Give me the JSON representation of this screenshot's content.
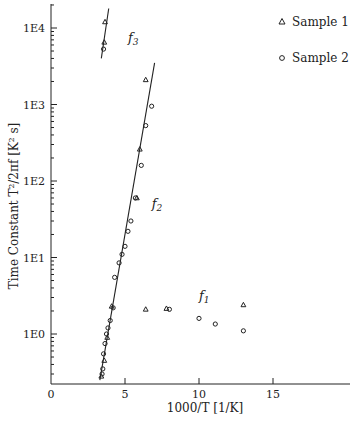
{
  "chart_data": {
    "type": "scatter",
    "title": "",
    "xlabel": "1000/T [1/K]",
    "ylabel": "Time Constant  T²/2πf [K² s]",
    "xlim": [
      0,
      20
    ],
    "ylim_log10": [
      -0.65,
      4.22
    ],
    "yscale": "log",
    "grid": false,
    "legend_position": "upper right",
    "x_ticks": [
      0,
      5,
      10,
      15
    ],
    "x_tick_labels": [
      "0",
      "5",
      "10",
      "15"
    ],
    "y_ticks_log10": [
      0,
      1,
      2,
      3,
      4
    ],
    "y_tick_labels": [
      "1E0",
      "1E1",
      "1E2",
      "1E3",
      "1E4"
    ],
    "legend": [
      {
        "label": "Sample 1",
        "marker": "triangle"
      },
      {
        "label": "Sample 2",
        "marker": "circle"
      }
    ],
    "annotations": [
      {
        "text": "f3",
        "x": 5.2,
        "y": 6500
      },
      {
        "text": "f2",
        "x": 6.8,
        "y": 45
      },
      {
        "text": "f1",
        "x": 10.0,
        "y": 2.8
      }
    ],
    "fit_lines": [
      {
        "name": "f3",
        "x": [
          3.4,
          3.9
        ],
        "y": [
          4000,
          18000
        ]
      },
      {
        "name": "f2",
        "x": [
          3.3,
          7.0
        ],
        "y": [
          0.25,
          3500
        ]
      }
    ],
    "series": [
      {
        "name": "Sample 1",
        "marker": "triangle",
        "points": [
          [
            3.65,
            12000
          ],
          [
            3.6,
            6500
          ],
          [
            3.4,
            0.28
          ],
          [
            3.6,
            0.45
          ],
          [
            3.8,
            0.9
          ],
          [
            4.1,
            2.3
          ],
          [
            5.8,
            60
          ],
          [
            6.4,
            2100
          ],
          [
            6.0,
            260
          ],
          [
            6.4,
            2.1
          ],
          [
            7.8,
            2.15
          ],
          [
            13.0,
            2.4
          ]
        ]
      },
      {
        "name": "Sample 2",
        "marker": "circle",
        "points": [
          [
            3.55,
            5300
          ],
          [
            3.45,
            0.3
          ],
          [
            3.5,
            0.35
          ],
          [
            3.55,
            0.55
          ],
          [
            3.65,
            0.75
          ],
          [
            3.75,
            1.0
          ],
          [
            3.85,
            1.2
          ],
          [
            4.0,
            1.5
          ],
          [
            4.2,
            2.2
          ],
          [
            4.3,
            5.5
          ],
          [
            4.6,
            8.5
          ],
          [
            4.8,
            11
          ],
          [
            5.0,
            14
          ],
          [
            5.2,
            22
          ],
          [
            5.4,
            30
          ],
          [
            5.7,
            60
          ],
          [
            6.1,
            160
          ],
          [
            6.4,
            530
          ],
          [
            6.8,
            950
          ],
          [
            8.0,
            2.1
          ],
          [
            10.0,
            1.6
          ],
          [
            11.1,
            1.35
          ],
          [
            13.0,
            1.1
          ]
        ]
      }
    ]
  }
}
